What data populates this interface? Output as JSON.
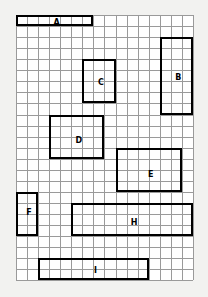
{
  "figure": {
    "type": "grid-rectangle-diagram",
    "background_color": "#f2f2f0",
    "grid_background_color": "#ffffff",
    "grid_line_color": "#9a9a9a",
    "rectangle_border_color": "#000000",
    "label_color": "#000000"
  },
  "grid": {
    "columns": 16,
    "rows": 24,
    "cell_width": 11.06,
    "cell_height": 11.06,
    "origin_x": 16,
    "origin_y": 15
  },
  "rectangles": [
    {
      "label": "A",
      "col": 0,
      "row": 0,
      "cols": 7,
      "rows": 1,
      "label_col_offset": 3.5,
      "label_row_offset": 0.5
    },
    {
      "label": "B",
      "col": 13,
      "row": 2,
      "cols": 3,
      "rows": 7,
      "label_col_offset": 1.5,
      "label_row_offset": 3.5
    },
    {
      "label": "C",
      "col": 6,
      "row": 4,
      "cols": 3,
      "rows": 4,
      "label_col_offset": 1.5,
      "label_row_offset": 2.0
    },
    {
      "label": "D",
      "col": 3,
      "row": 9,
      "cols": 5,
      "rows": 4,
      "label_col_offset": 2.5,
      "label_row_offset": 2.2
    },
    {
      "label": "E",
      "col": 9,
      "row": 12,
      "cols": 6,
      "rows": 4,
      "label_col_offset": 3.0,
      "label_row_offset": 2.3
    },
    {
      "label": "F",
      "col": 0,
      "row": 16,
      "cols": 2,
      "rows": 4,
      "label_col_offset": 1.0,
      "label_row_offset": 1.7
    },
    {
      "label": "H",
      "col": 5,
      "row": 17,
      "cols": 11,
      "rows": 3,
      "label_col_offset": 5.5,
      "label_row_offset": 1.6
    },
    {
      "label": "I",
      "col": 2,
      "row": 22,
      "cols": 10,
      "rows": 2,
      "label_col_offset": 5.0,
      "label_row_offset": 1.0
    }
  ]
}
